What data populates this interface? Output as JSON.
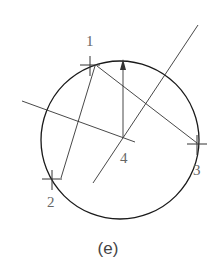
{
  "figure": {
    "caption": "(e)",
    "circle": {
      "cx": 120,
      "cy": 140,
      "r": 79,
      "stroke": "#1a1a1a"
    },
    "points": [
      {
        "id": "1",
        "label": "1",
        "x": 90,
        "y": 65,
        "label_x": 86,
        "label_y": 46
      },
      {
        "id": "2",
        "label": "2",
        "x": 52,
        "y": 179,
        "label_x": 47,
        "label_y": 207
      },
      {
        "id": "3",
        "label": "3",
        "x": 197,
        "y": 144,
        "label_x": 193,
        "label_y": 175
      },
      {
        "id": "4",
        "label": "4",
        "x": 123,
        "y": 137,
        "label_x": 120,
        "label_y": 163
      }
    ],
    "chords": [
      {
        "name": "chord-1-2",
        "x1": 95,
        "y1": 66,
        "x2": 61,
        "y2": 178
      },
      {
        "name": "chord-1-3",
        "x1": 97,
        "y1": 66,
        "x2": 197,
        "y2": 143
      }
    ],
    "bisectors": [
      {
        "name": "bisector-line-a",
        "x1": 22,
        "y1": 101,
        "x2": 135,
        "y2": 142
      },
      {
        "name": "bisector-line-b",
        "x1": 93,
        "y1": 183,
        "x2": 198,
        "y2": 25
      }
    ],
    "arrow": {
      "x1": 123,
      "y1": 137,
      "x2": 123,
      "y2": 59
    },
    "line_color": "#333333",
    "label_color": "#666666"
  }
}
